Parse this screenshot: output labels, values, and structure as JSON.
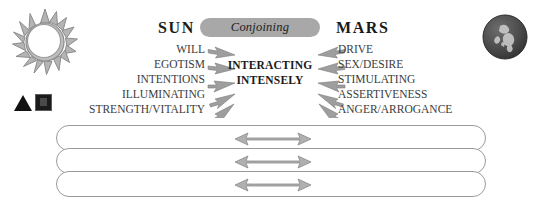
{
  "diagram": {
    "type": "astrology-aspect-diagram",
    "left_body": {
      "name": "SUN",
      "icon": "sun-icon",
      "keywords": [
        "WILL",
        "EGOTISM",
        "INTENTIONS",
        "ILLUMINATING",
        "STRENGTH/VITALITY"
      ]
    },
    "right_body": {
      "name": "MARS",
      "icon": "mars-planet-icon",
      "keywords": [
        "DRIVE",
        "SEX/DESIRE",
        "STIMULATING",
        "ASSERTIVENESS",
        "ANGER/ARROGANCE"
      ]
    },
    "aspect": {
      "label": "Conjoining"
    },
    "interaction": {
      "line1": "INTERACTING",
      "line2": "INTENSELY"
    },
    "glyphs": [
      {
        "name": "triangle-glyph",
        "shape": "triangle"
      },
      {
        "name": "square-glyph",
        "shape": "square"
      }
    ],
    "bars": [
      {
        "name": "bar-row-0",
        "arrow": "double-headed-arrow"
      },
      {
        "name": "bar-row-1",
        "arrow": "double-headed-arrow"
      },
      {
        "name": "bar-row-2",
        "arrow": "double-headed-arrow"
      }
    ],
    "colors": {
      "pill_fill": "#a8a8a8",
      "arrow_fill": "#9e9e9e",
      "arrow_stroke": "#7a7a7a",
      "bar_border": "#9a9a9a",
      "text": "#3c3c3c",
      "heading": "#1a1a1a",
      "sun_outline": "#8c8c8c",
      "mars_body": "#4a4a4a"
    }
  }
}
